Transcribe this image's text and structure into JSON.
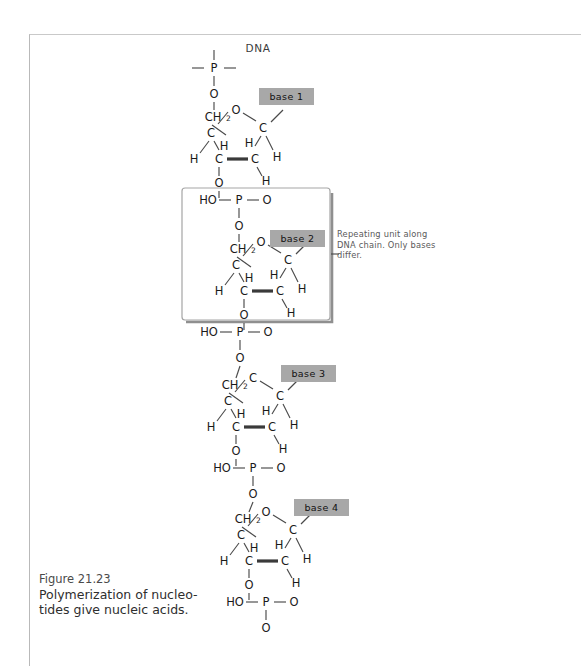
{
  "figure": {
    "label": "Figure 21.23",
    "caption": "Polymerization of nucleo-tides give nucleic acids."
  },
  "diagram": {
    "title": "DNA",
    "annotation": "Repeating unit along DNA chain. Only bases differ.",
    "atoms": {
      "phosphorus": "P",
      "oxygen": "O",
      "carbon": "C",
      "hydrogen": "H",
      "hydroxyl": "HO",
      "methylene": "CH",
      "methylene_sub": "2"
    },
    "phosphate_group": "HO—P—O",
    "bases": [
      {
        "label": "base 1"
      },
      {
        "label": "base 2"
      },
      {
        "label": "base 3"
      },
      {
        "label": "base 4"
      }
    ],
    "ring_apex_labels": [
      "O",
      "O",
      "C",
      "O"
    ],
    "colors": {
      "base_box_fill": "#a8a8a8",
      "base_box_text": "#000000",
      "bond": "#4a4a4a",
      "atom_text": "#1a1a1a",
      "page_border": "#b9b9b9",
      "repeat_box": "#9a9a9a",
      "note_text": "#5a5a5a",
      "caption_text": "#2e2e2e"
    }
  }
}
